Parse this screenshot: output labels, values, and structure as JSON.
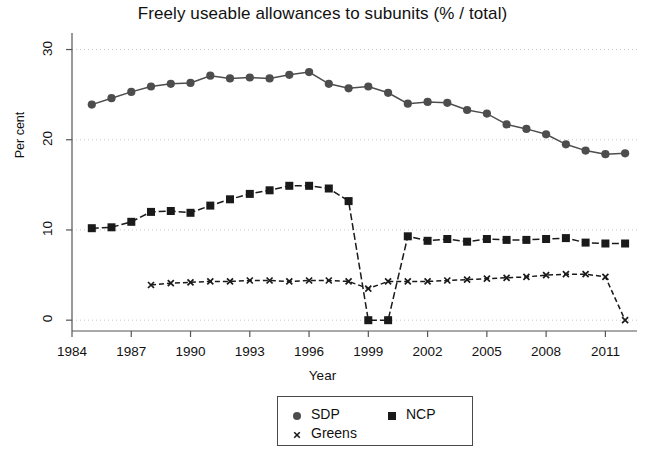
{
  "chart_data": {
    "type": "line",
    "title": "Freely useable allowances to subunits (% / total)",
    "xlabel": "Year",
    "ylabel": "Per cent",
    "xlim": [
      1984.0,
      2012.6
    ],
    "ylim": [
      -1.2,
      31.5
    ],
    "xticks": [
      1984,
      1987,
      1990,
      1993,
      1996,
      1999,
      2002,
      2005,
      2008,
      2011
    ],
    "yticks": [
      0,
      10,
      20,
      30
    ],
    "grid": "horizontal-dotted",
    "legend_position": "bottom-center",
    "series": [
      {
        "name": "SDP",
        "marker": "circle",
        "color": "#4d4d4d",
        "x": [
          1985,
          1986,
          1987,
          1988,
          1989,
          1990,
          1991,
          1992,
          1993,
          1994,
          1995,
          1996,
          1997,
          1998,
          1999,
          2000,
          2001,
          2002,
          2003,
          2004,
          2005,
          2006,
          2007,
          2008,
          2009,
          2010,
          2011,
          2012
        ],
        "values": [
          23.9,
          24.6,
          25.3,
          25.9,
          26.2,
          26.3,
          27.1,
          26.8,
          26.9,
          26.8,
          27.2,
          27.5,
          26.2,
          25.7,
          25.9,
          25.2,
          24.0,
          24.2,
          24.1,
          23.3,
          22.9,
          21.7,
          21.2,
          20.6,
          19.5,
          18.8,
          18.4,
          18.5
        ]
      },
      {
        "name": "NCP",
        "marker": "square",
        "color": "#1a1a1a",
        "x": [
          1985,
          1986,
          1987,
          1988,
          1989,
          1990,
          1991,
          1992,
          1993,
          1994,
          1995,
          1996,
          1997,
          1998,
          1999,
          2000,
          2001,
          2002,
          2003,
          2004,
          2005,
          2006,
          2007,
          2008,
          2009,
          2010,
          2011,
          2012
        ],
        "values": [
          10.2,
          10.3,
          10.9,
          12.0,
          12.1,
          11.9,
          12.7,
          13.4,
          14.0,
          14.4,
          14.9,
          14.9,
          14.6,
          13.2,
          0.0,
          0.0,
          9.3,
          8.8,
          9.0,
          8.7,
          9.0,
          8.9,
          8.9,
          9.0,
          9.1,
          8.6,
          8.5,
          8.5
        ]
      },
      {
        "name": "Greens",
        "marker": "x",
        "color": "#1a1a1a",
        "x": [
          1988,
          1989,
          1990,
          1991,
          1992,
          1993,
          1994,
          1995,
          1996,
          1997,
          1998,
          1999,
          2000,
          2001,
          2002,
          2003,
          2004,
          2005,
          2006,
          2007,
          2008,
          2009,
          2010,
          2011,
          2012
        ],
        "values": [
          3.9,
          4.1,
          4.2,
          4.3,
          4.3,
          4.4,
          4.4,
          4.3,
          4.4,
          4.4,
          4.3,
          3.5,
          4.3,
          4.3,
          4.3,
          4.4,
          4.5,
          4.6,
          4.7,
          4.8,
          5.0,
          5.1,
          5.1,
          4.8,
          0.0
        ]
      }
    ]
  },
  "legend": {
    "entries": [
      {
        "label": "SDP",
        "marker": "circle"
      },
      {
        "label": "NCP",
        "marker": "square"
      },
      {
        "label": "Greens",
        "marker": "x"
      }
    ]
  }
}
